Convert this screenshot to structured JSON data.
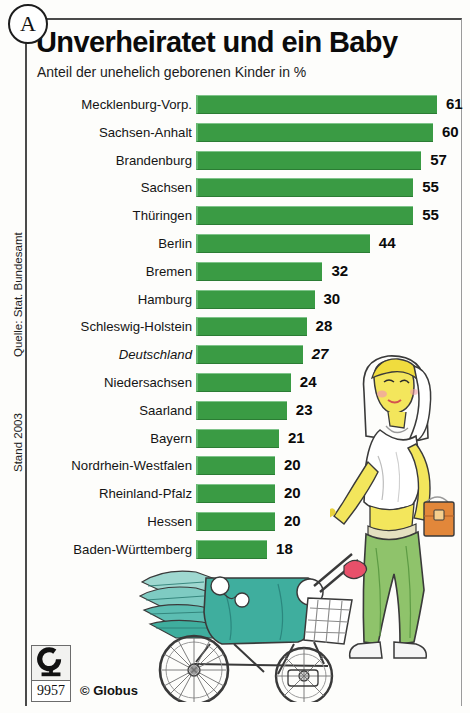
{
  "marker": {
    "label": "A"
  },
  "header": {
    "title": "Unverheiratet und ein Baby",
    "subtitle": "Anteil der unehelich geborenen Kinder in %"
  },
  "side_notes": {
    "source": "Quelle: Stat. Bundesamt",
    "date": "Stand 2003"
  },
  "footer": {
    "logo_letter": "G",
    "number": "9957",
    "copyright": "© Globus"
  },
  "illustration": {
    "woman": "woman-pushing-stroller-illustration",
    "stroller": "baby-stroller-illustration"
  },
  "colors": {
    "bar_green": "#3a9b44",
    "stroller_teal": "#3fae9e",
    "hair_yellow": "#f2e24a",
    "pants_green": "#8fc36b",
    "bag_orange": "#e2873a"
  },
  "chart_data": {
    "type": "bar",
    "title": "Unverheiratet und ein Baby",
    "subtitle": "Anteil der unehelich geborenen Kinder in %",
    "xlabel": "",
    "ylabel": "",
    "unit": "%",
    "orientation": "horizontal",
    "grid": false,
    "legend": "none",
    "xlim": [
      0,
      61
    ],
    "source": "Quelle: Stat. Bundesamt",
    "date": "Stand 2003",
    "categories": [
      "Mecklenburg-Vorp.",
      "Sachsen-Anhalt",
      "Brandenburg",
      "Sachsen",
      "Thüringen",
      "Berlin",
      "Bremen",
      "Hamburg",
      "Schleswig-Holstein",
      "Deutschland",
      "Niedersachsen",
      "Saarland",
      "Bayern",
      "Nordrhein-Westfalen",
      "Rheinland-Pfalz",
      "Hessen",
      "Baden-Württemberg"
    ],
    "values": [
      61,
      60,
      57,
      55,
      55,
      44,
      32,
      30,
      28,
      27,
      24,
      23,
      21,
      20,
      20,
      20,
      18
    ],
    "emphasis_index": 9,
    "emphasis_style": "italic"
  }
}
